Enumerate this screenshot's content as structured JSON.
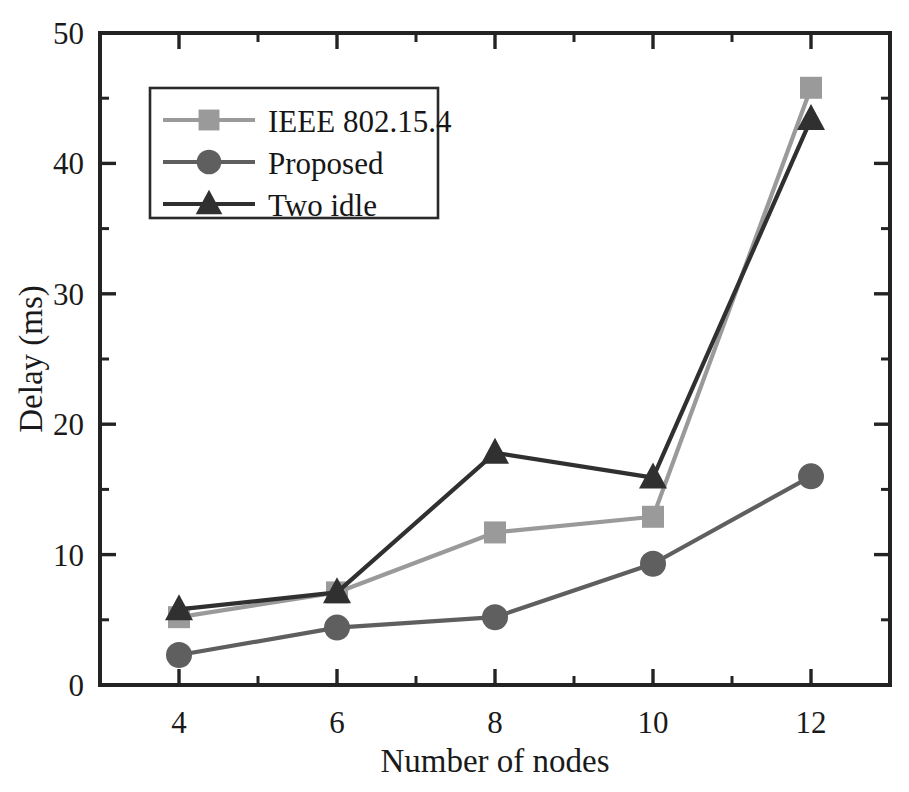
{
  "chart_data": {
    "type": "line",
    "title": "",
    "xlabel": "Number of nodes",
    "ylabel": "Delay (ms)",
    "xlim": [
      3,
      13
    ],
    "ylim": [
      0,
      50
    ],
    "x": [
      4,
      6,
      8,
      10,
      12
    ],
    "xticks": [
      4,
      6,
      8,
      10,
      12
    ],
    "xtick_labels": [
      "4",
      "6",
      "8",
      "10",
      "12"
    ],
    "xminorticks": [
      3,
      5,
      7,
      9,
      11,
      13
    ],
    "yticks": [
      0,
      10,
      20,
      30,
      40,
      50
    ],
    "ytick_labels": [
      "0",
      "10",
      "20",
      "30",
      "40",
      "50"
    ],
    "yminorticks": [
      5,
      15,
      25,
      35,
      45
    ],
    "grid": false,
    "legend_position": "upper left",
    "series": [
      {
        "name": "IEEE 802.15.4",
        "marker": "square",
        "color": "#9a9a9a",
        "values": [
          5.2,
          7.1,
          11.7,
          12.9,
          45.8
        ]
      },
      {
        "name": "Proposed",
        "marker": "circle",
        "color": "#5f5f5f",
        "values": [
          2.3,
          4.4,
          5.2,
          9.3,
          16.0
        ]
      },
      {
        "name": "Two idle",
        "marker": "triangle",
        "color": "#303030",
        "values": [
          5.8,
          7.1,
          17.8,
          15.9,
          43.4
        ]
      }
    ]
  },
  "figure": {
    "background_color": "#ffffff",
    "axis_color": "#232323"
  }
}
